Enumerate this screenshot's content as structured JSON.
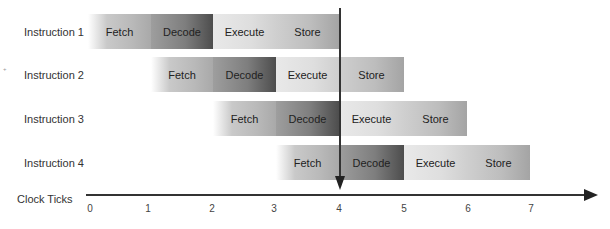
{
  "rows": [
    {
      "label": "Instruction 1",
      "stages": [
        "Fetch",
        "Decode",
        "Execute",
        "Store"
      ],
      "start_tick": 0
    },
    {
      "label": "Instruction 2",
      "stages": [
        "Fetch",
        "Decode",
        "Execute",
        "Store"
      ],
      "start_tick": 1
    },
    {
      "label": "Instruction 3",
      "stages": [
        "Fetch",
        "Decode",
        "Execute",
        "Store"
      ],
      "start_tick": 2
    },
    {
      "label": "Instruction 4",
      "stages": [
        "Fetch",
        "Decode",
        "Execute",
        "Store"
      ],
      "start_tick": 3
    }
  ],
  "axis": {
    "label": "Clock Ticks",
    "ticks": [
      "0",
      "1",
      "2",
      "3",
      "4",
      "5",
      "6",
      "7"
    ]
  },
  "marker": {
    "tick": 4
  },
  "colors": {
    "fetch": "#b9b9b9",
    "decode": "#6a6a6a",
    "execute": "#e0e0e0",
    "store": "#bdbdbd",
    "axis": "#333333"
  }
}
